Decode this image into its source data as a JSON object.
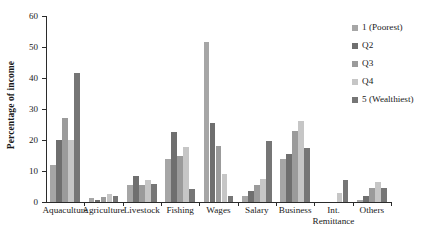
{
  "chart_data": {
    "type": "bar",
    "title": "",
    "subtitle": "",
    "xlabel": "",
    "ylabel": "Percentage of income",
    "ylim": [
      0,
      60
    ],
    "yticks": [
      0,
      10,
      20,
      30,
      40,
      50,
      60
    ],
    "grid": false,
    "legend_position": "right",
    "categories": [
      "Aquaculture",
      "Agriculture",
      "Livestock",
      "Fishing",
      "Wages",
      "Salary",
      "Business",
      "Int.\nRemittance",
      "Others"
    ],
    "series": [
      {
        "name": "1 (Poorest)",
        "color": "#a6a6a6",
        "values": [
          12.0,
          1.2,
          5.5,
          14.0,
          51.5,
          2.0,
          13.8,
          0.0,
          0.5
        ]
      },
      {
        "name": "Q2",
        "color": "#6f6f6f",
        "values": [
          20.0,
          0.5,
          8.5,
          22.5,
          25.5,
          3.5,
          15.5,
          0.0,
          2.0
        ]
      },
      {
        "name": "Q3",
        "color": "#9b9b9b",
        "values": [
          27.0,
          1.7,
          5.5,
          15.0,
          18.0,
          5.5,
          23.0,
          0.0,
          4.5
        ]
      },
      {
        "name": "Q4",
        "color": "#c6c6c6",
        "values": [
          20.0,
          2.5,
          7.0,
          17.8,
          9.0,
          7.5,
          26.0,
          3.0,
          6.3
        ]
      },
      {
        "name": "5 (Wealthiest)",
        "color": "#767676",
        "values": [
          41.5,
          2.0,
          5.7,
          4.3,
          2.0,
          19.8,
          17.3,
          7.0,
          4.5
        ]
      }
    ]
  },
  "axis": {
    "y_title": "Percentage of income"
  }
}
